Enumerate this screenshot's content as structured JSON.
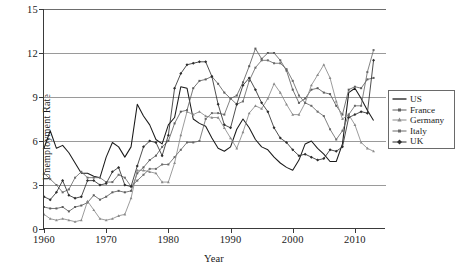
{
  "chart_data": {
    "type": "line",
    "title": "",
    "xlabel": "Year",
    "ylabel": "Unemployment Rate",
    "xlim": [
      1960,
      2015
    ],
    "ylim": [
      0,
      15
    ],
    "xticks": [
      1960,
      1970,
      1980,
      1990,
      2000,
      2010
    ],
    "yticks": [
      0,
      3,
      6,
      9,
      12,
      15
    ],
    "grid": "horizontal",
    "legend_position": "right",
    "x": [
      1960,
      1961,
      1962,
      1963,
      1964,
      1965,
      1966,
      1967,
      1968,
      1969,
      1970,
      1971,
      1972,
      1973,
      1974,
      1975,
      1976,
      1977,
      1978,
      1979,
      1980,
      1981,
      1982,
      1983,
      1984,
      1985,
      1986,
      1987,
      1988,
      1989,
      1990,
      1991,
      1992,
      1993,
      1994,
      1995,
      1996,
      1997,
      1998,
      1999,
      2000,
      2001,
      2002,
      2003,
      2004,
      2005,
      2006,
      2007,
      2008,
      2009,
      2010,
      2011,
      2012,
      2013
    ],
    "series": [
      {
        "name": "US",
        "color": "#1a1a1a",
        "marker": "none",
        "values": [
          5.5,
          6.7,
          5.5,
          5.7,
          5.2,
          4.5,
          3.8,
          3.8,
          3.6,
          3.5,
          4.9,
          5.9,
          5.6,
          4.9,
          5.6,
          8.5,
          7.7,
          7.1,
          6.1,
          5.8,
          7.1,
          7.6,
          9.7,
          9.6,
          7.5,
          7.2,
          7.0,
          6.2,
          5.5,
          5.3,
          5.6,
          6.8,
          7.5,
          6.9,
          6.1,
          5.6,
          5.4,
          4.9,
          4.5,
          4.2,
          4.0,
          4.7,
          5.8,
          6.0,
          5.5,
          5.1,
          4.6,
          4.6,
          5.8,
          9.3,
          9.6,
          8.9,
          8.1,
          7.4
        ]
      },
      {
        "name": "France",
        "color": "#5e5e5e",
        "marker": "dash",
        "values": [
          1.5,
          1.4,
          1.4,
          1.5,
          1.2,
          1.5,
          1.6,
          1.8,
          2.3,
          2.0,
          2.2,
          2.5,
          2.6,
          2.5,
          2.6,
          3.8,
          4.2,
          4.7,
          5.0,
          5.6,
          6.0,
          7.2,
          8.0,
          8.1,
          9.6,
          10.1,
          10.2,
          10.4,
          9.9,
          9.3,
          8.9,
          9.1,
          10.0,
          11.1,
          12.3,
          11.6,
          12.0,
          12.0,
          11.5,
          10.8,
          9.5,
          8.6,
          8.9,
          9.5,
          9.6,
          9.3,
          9.2,
          8.4,
          7.8,
          9.5,
          9.7,
          9.6,
          10.2,
          10.3
        ]
      },
      {
        "name": "Germany",
        "color": "#8a8a8a",
        "marker": "tri",
        "values": [
          1.0,
          0.7,
          0.6,
          0.7,
          0.6,
          0.5,
          0.6,
          1.9,
          1.3,
          0.7,
          0.6,
          0.7,
          0.9,
          1.0,
          2.1,
          4.0,
          4.0,
          3.9,
          3.8,
          3.2,
          3.2,
          4.5,
          6.4,
          8.0,
          7.8,
          8.0,
          7.7,
          7.6,
          7.6,
          6.9,
          6.2,
          5.5,
          6.6,
          7.9,
          8.4,
          8.2,
          8.9,
          9.9,
          9.3,
          8.5,
          7.8,
          7.8,
          8.6,
          9.8,
          10.5,
          11.2,
          10.3,
          8.7,
          7.5,
          7.8,
          7.1,
          5.9,
          5.5,
          5.3
        ]
      },
      {
        "name": "Italy",
        "color": "#6b6b6b",
        "marker": "dash",
        "values": [
          3.8,
          3.4,
          3.0,
          2.5,
          2.7,
          3.5,
          3.9,
          3.5,
          3.5,
          3.5,
          3.2,
          3.2,
          3.7,
          3.5,
          2.9,
          3.3,
          3.7,
          4.1,
          4.1,
          4.4,
          4.4,
          4.9,
          5.4,
          5.9,
          5.9,
          6.0,
          7.5,
          7.9,
          7.9,
          7.8,
          8.9,
          8.5,
          8.7,
          10.1,
          11.0,
          11.5,
          11.5,
          11.3,
          11.3,
          10.9,
          10.1,
          9.1,
          8.6,
          8.4,
          8.0,
          7.7,
          6.8,
          6.1,
          6.7,
          7.8,
          8.4,
          8.4,
          10.7,
          12.2
        ]
      },
      {
        "name": "UK",
        "color": "#2e2e2e",
        "marker": "diamond",
        "values": [
          2.2,
          2.0,
          2.5,
          3.3,
          2.3,
          2.1,
          2.2,
          3.3,
          3.3,
          3.0,
          3.1,
          3.9,
          4.2,
          3.0,
          2.9,
          4.3,
          5.6,
          6.0,
          5.9,
          5.0,
          6.4,
          9.6,
          10.6,
          11.2,
          11.3,
          11.4,
          11.4,
          10.4,
          8.5,
          7.1,
          6.9,
          8.5,
          9.8,
          10.3,
          9.5,
          8.6,
          8.0,
          6.9,
          6.2,
          5.9,
          5.4,
          5.0,
          5.1,
          4.9,
          4.7,
          4.8,
          5.4,
          5.3,
          5.6,
          7.6,
          7.8,
          8.0,
          7.9,
          11.5
        ]
      }
    ]
  },
  "legend": {
    "items": [
      {
        "label": "US"
      },
      {
        "label": "France"
      },
      {
        "label": "Germany"
      },
      {
        "label": "Italy"
      },
      {
        "label": "UK"
      }
    ]
  },
  "axes": {
    "y_title": "Unemployment Rate",
    "x_title": "Year",
    "y_tick_labels": [
      "0",
      "3",
      "6",
      "9",
      "12",
      "15"
    ],
    "x_tick_labels": [
      "1960",
      "1970",
      "1980",
      "1990",
      "2000",
      "2010"
    ]
  }
}
